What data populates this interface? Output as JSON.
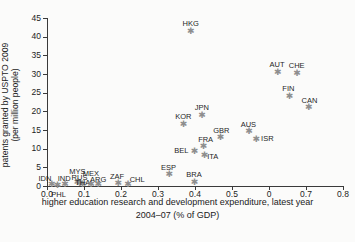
{
  "chart_data": {
    "type": "scatter",
    "title": "",
    "xlabel": "higher education research and development expenditure, latest year 2004–07 (% of GDP)",
    "xlabel_line1": "higher education research and development expenditure, latest year",
    "xlabel_line2": "2004–07 (% of GDP)",
    "ylabel": "patents granted by USPTO 2009 (per million people)",
    "ylabel_line1": "patents granted by USPTO 2009",
    "ylabel_line2": "(per million people)",
    "xlim": [
      0.0,
      0.8
    ],
    "ylim": [
      0,
      45
    ],
    "xticks": [
      0.0,
      0.1,
      0.2,
      0.3,
      0.4,
      0.5,
      0.6,
      0.7,
      0.8
    ],
    "xtick_labels": [
      "0.0",
      "0.1",
      "0.2",
      "0.3",
      "0.4",
      "0.5",
      "0",
      "0.7",
      "0.8"
    ],
    "yticks": [
      0,
      5,
      10,
      15,
      20,
      25,
      30,
      35,
      40,
      45
    ],
    "ytick_labels": [
      "0",
      "5",
      "10",
      "15",
      "20",
      "25",
      "30",
      "35",
      "40",
      "45"
    ],
    "grid": false,
    "legend": "none",
    "marker": "asterisk",
    "marker_color": "#8e8e8e",
    "label_color": "#1f1f1f",
    "points": [
      {
        "label": "IDN",
        "x": 0.012,
        "y": 0.3,
        "lx": -13,
        "ly": -10
      },
      {
        "label": "PHL",
        "x": 0.028,
        "y": 0.2,
        "lx": -6,
        "ly": 6
      },
      {
        "label": "IND",
        "x": 0.048,
        "y": 0.4,
        "lx": -7,
        "ly": -10
      },
      {
        "label": "MYS",
        "x": 0.082,
        "y": 0.9,
        "lx": -8,
        "ly": -15
      },
      {
        "label": "RUS",
        "x": 0.088,
        "y": 0.8,
        "lx": -8,
        "ly": -9
      },
      {
        "label": "THA",
        "x": 0.095,
        "y": 0.3,
        "lx": -7,
        "ly": -6
      },
      {
        "label": "MEX",
        "x": 0.118,
        "y": 0.4,
        "lx": -8,
        "ly": -15
      },
      {
        "label": "ARG",
        "x": 0.138,
        "y": 0.4,
        "lx": -8,
        "ly": -9
      },
      {
        "label": "ZAF",
        "x": 0.192,
        "y": 0.7,
        "lx": -8,
        "ly": -10
      },
      {
        "label": "CHL",
        "x": 0.218,
        "y": 0.5,
        "lx": 2,
        "ly": -8
      },
      {
        "label": "ESP",
        "x": 0.33,
        "y": 3.0,
        "lx": -8,
        "ly": -11
      },
      {
        "label": "BRA",
        "x": 0.398,
        "y": 1.0,
        "lx": -8,
        "ly": -11
      },
      {
        "label": "BEL",
        "x": 0.398,
        "y": 9.2,
        "lx": -20,
        "ly": -5
      },
      {
        "label": "ITA",
        "x": 0.425,
        "y": 8.2,
        "lx": 3,
        "ly": -2
      },
      {
        "label": "FRA",
        "x": 0.422,
        "y": 10.5,
        "lx": -5,
        "ly": -11
      },
      {
        "label": "GBR",
        "x": 0.468,
        "y": 13.0,
        "lx": -7,
        "ly": -10
      },
      {
        "label": "KOR",
        "x": 0.368,
        "y": 16.5,
        "lx": -8,
        "ly": -11
      },
      {
        "label": "JPN",
        "x": 0.418,
        "y": 19.0,
        "lx": -7,
        "ly": -11
      },
      {
        "label": "AUS",
        "x": 0.545,
        "y": 14.5,
        "lx": -8,
        "ly": -11
      },
      {
        "label": "ISR",
        "x": 0.565,
        "y": 12.5,
        "lx": 5,
        "ly": -4
      },
      {
        "label": "HKG",
        "x": 0.388,
        "y": 41.5,
        "lx": -8,
        "ly": -11
      },
      {
        "label": "AUT",
        "x": 0.623,
        "y": 30.5,
        "lx": -8,
        "ly": -11
      },
      {
        "label": "CHE",
        "x": 0.675,
        "y": 30.2,
        "lx": -8,
        "ly": -11
      },
      {
        "label": "FIN",
        "x": 0.655,
        "y": 24.0,
        "lx": -7,
        "ly": -11
      },
      {
        "label": "CAN",
        "x": 0.707,
        "y": 21.0,
        "lx": -7,
        "ly": -11
      }
    ]
  }
}
